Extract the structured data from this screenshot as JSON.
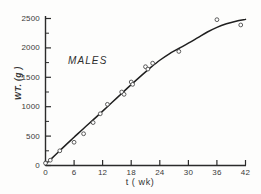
{
  "chart_data": {
    "type": "scatter",
    "title": "",
    "subtitle": "",
    "annotation": "MALES",
    "xlabel": "t ( wk)",
    "ylabel": "WT. (g )",
    "xlim": [
      0,
      42
    ],
    "ylim": [
      0,
      2500
    ],
    "xticks": [
      0,
      6,
      12,
      18,
      24,
      30,
      36,
      42
    ],
    "yticks": [
      0,
      500,
      1000,
      1500,
      2000,
      2500
    ],
    "xtick_labels": [
      "0",
      "6",
      "12",
      "18",
      "24",
      "30",
      "36",
      "42"
    ],
    "ytick_labels": [
      "0",
      "500",
      "1000",
      "1500",
      "2000",
      "2500"
    ],
    "grid": false,
    "legend": "none",
    "minor_yticks": [
      250,
      750,
      1250,
      1750,
      2250
    ],
    "marker": "open-circle",
    "series": [
      {
        "name": "MALES observed weight",
        "marker": "open-circle",
        "points": [
          {
            "x": 0,
            "y": 40
          },
          {
            "x": 1,
            "y": 90
          },
          {
            "x": 3,
            "y": 250
          },
          {
            "x": 6,
            "y": 395
          },
          {
            "x": 8,
            "y": 540
          },
          {
            "x": 10,
            "y": 730
          },
          {
            "x": 11.5,
            "y": 880
          },
          {
            "x": 13,
            "y": 1040
          },
          {
            "x": 16,
            "y": 1250
          },
          {
            "x": 16.5,
            "y": 1210
          },
          {
            "x": 18,
            "y": 1420
          },
          {
            "x": 18.3,
            "y": 1380
          },
          {
            "x": 21,
            "y": 1680
          },
          {
            "x": 21.5,
            "y": 1640
          },
          {
            "x": 22.5,
            "y": 1740
          },
          {
            "x": 28,
            "y": 1940
          },
          {
            "x": 36,
            "y": 2480
          },
          {
            "x": 41,
            "y": 2390
          }
        ]
      },
      {
        "name": "fitted growth curve",
        "type": "line",
        "points": [
          {
            "x": 0,
            "y": 20
          },
          {
            "x": 2,
            "y": 175
          },
          {
            "x": 4,
            "y": 330
          },
          {
            "x": 6,
            "y": 480
          },
          {
            "x": 8,
            "y": 630
          },
          {
            "x": 10,
            "y": 775
          },
          {
            "x": 12,
            "y": 925
          },
          {
            "x": 14,
            "y": 1075
          },
          {
            "x": 16,
            "y": 1225
          },
          {
            "x": 18,
            "y": 1375
          },
          {
            "x": 20,
            "y": 1520
          },
          {
            "x": 22,
            "y": 1660
          },
          {
            "x": 24,
            "y": 1790
          },
          {
            "x": 26,
            "y": 1900
          },
          {
            "x": 28,
            "y": 1990
          },
          {
            "x": 30,
            "y": 2080
          },
          {
            "x": 32,
            "y": 2175
          },
          {
            "x": 34,
            "y": 2270
          },
          {
            "x": 36,
            "y": 2350
          },
          {
            "x": 38,
            "y": 2410
          },
          {
            "x": 40,
            "y": 2455
          },
          {
            "x": 42,
            "y": 2485
          }
        ]
      }
    ],
    "colors": {
      "axis": "#2b2b2b",
      "curve": "#1f1f1f",
      "marker_edge": "#4a4a4a",
      "marker_fill": "#ffffff",
      "background": "#fdfdfc",
      "text": "#2e2e2e"
    }
  }
}
